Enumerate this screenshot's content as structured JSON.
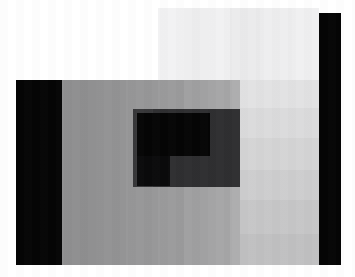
{
  "image": {
    "kind": "photograph",
    "subject": "pixelated grayscale photo with dark letterbox bars",
    "width_px": 355,
    "height_px": 277,
    "background_color": "#ffffff",
    "palette": {
      "white": "#ffffff",
      "near_white": "#f4f4f5",
      "light_gray_1": "#ececed",
      "light_gray_2": "#e4e4e5",
      "light_gray_3": "#dcdcdd",
      "light_gray_4": "#d4d4d6",
      "mid_gray_1": "#8f8f90",
      "mid_gray_2": "#949495",
      "mid_gray_3": "#9a9a9b",
      "mid_gray_4": "#a2a2a3",
      "mid_gray_5": "#ababac",
      "mid_gray_6": "#b4b4b5",
      "dark_block": "#2f2f31",
      "dark_block_2": "#343436",
      "black": "#050505"
    },
    "regions": [
      {
        "name": "top-left-white-field",
        "color": "#ffffff",
        "x": 0,
        "y": 0,
        "w": 158,
        "h": 80
      },
      {
        "name": "top-light-band-a",
        "color": "#f2f2f3",
        "x": 158,
        "y": 8,
        "w": 26,
        "h": 72
      },
      {
        "name": "top-light-band-b",
        "color": "#eeeeef",
        "x": 184,
        "y": 8,
        "w": 24,
        "h": 72
      },
      {
        "name": "top-light-band-c",
        "color": "#f1f1f2",
        "x": 208,
        "y": 8,
        "w": 22,
        "h": 72
      },
      {
        "name": "top-light-band-d",
        "color": "#ebebec",
        "x": 230,
        "y": 8,
        "w": 30,
        "h": 72
      },
      {
        "name": "top-light-band-e",
        "color": "#eeeeef",
        "x": 260,
        "y": 8,
        "w": 32,
        "h": 72
      },
      {
        "name": "top-light-band-f",
        "color": "#f0f0f1",
        "x": 292,
        "y": 8,
        "w": 27,
        "h": 72
      },
      {
        "name": "left-black-bar",
        "color": "#050505",
        "x": 16,
        "y": 80,
        "w": 46,
        "h": 185
      },
      {
        "name": "right-black-bar",
        "color": "#050505",
        "x": 319,
        "y": 13,
        "w": 22,
        "h": 252
      },
      {
        "name": "body-gray-band-1",
        "color": "#8f8f90",
        "x": 62,
        "y": 80,
        "w": 34,
        "h": 185
      },
      {
        "name": "body-gray-band-2",
        "color": "#939394",
        "x": 96,
        "y": 80,
        "w": 30,
        "h": 185
      },
      {
        "name": "body-gray-band-3",
        "color": "#979798",
        "x": 126,
        "y": 80,
        "w": 32,
        "h": 185
      },
      {
        "name": "body-gray-band-4",
        "color": "#9b9b9c",
        "x": 158,
        "y": 80,
        "w": 26,
        "h": 185
      },
      {
        "name": "body-gray-band-5",
        "color": "#a0a0a1",
        "x": 184,
        "y": 80,
        "w": 24,
        "h": 185
      },
      {
        "name": "body-gray-band-6",
        "color": "#a6a6a7",
        "x": 208,
        "y": 80,
        "w": 22,
        "h": 185
      },
      {
        "name": "body-gray-band-7",
        "color": "#adadae",
        "x": 230,
        "y": 80,
        "w": 30,
        "h": 185
      },
      {
        "name": "body-gray-band-8",
        "color": "#b2b2b3",
        "x": 260,
        "y": 80,
        "w": 32,
        "h": 185
      },
      {
        "name": "body-gray-band-9",
        "color": "#b6b6b7",
        "x": 292,
        "y": 80,
        "w": 27,
        "h": 185
      },
      {
        "name": "upper-right-light-block-1",
        "color": "#e2e2e3",
        "x": 240,
        "y": 80,
        "w": 79,
        "h": 28
      },
      {
        "name": "upper-right-light-block-2",
        "color": "#dbdbdc",
        "x": 240,
        "y": 108,
        "w": 79,
        "h": 30
      },
      {
        "name": "upper-right-light-block-3",
        "color": "#d4d4d5",
        "x": 240,
        "y": 138,
        "w": 79,
        "h": 32
      },
      {
        "name": "upper-right-light-block-4",
        "color": "#cdcdce",
        "x": 240,
        "y": 170,
        "w": 79,
        "h": 30
      },
      {
        "name": "upper-right-light-block-5",
        "color": "#c6c6c7",
        "x": 240,
        "y": 200,
        "w": 79,
        "h": 34
      },
      {
        "name": "upper-right-light-block-6",
        "color": "#c0c0c1",
        "x": 240,
        "y": 234,
        "w": 79,
        "h": 31
      },
      {
        "name": "center-dark-block",
        "color": "#2f2f31",
        "x": 133,
        "y": 109,
        "w": 107,
        "h": 78
      },
      {
        "name": "center-dark-block-left-shade",
        "color": "#38383a",
        "x": 133,
        "y": 109,
        "w": 20,
        "h": 78
      },
      {
        "name": "inner-black-upper",
        "color": "#050505",
        "x": 137,
        "y": 113,
        "w": 73,
        "h": 43
      },
      {
        "name": "inner-black-lower-step",
        "color": "#0a0a0b",
        "x": 137,
        "y": 156,
        "w": 33,
        "h": 30
      }
    ]
  }
}
